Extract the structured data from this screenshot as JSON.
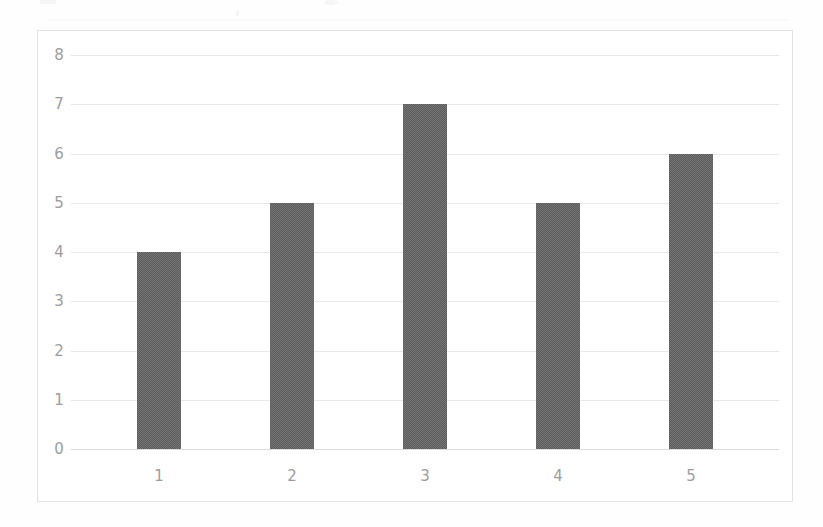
{
  "chart_data": {
    "type": "bar",
    "title": "",
    "subtitle": "",
    "xlabel": "",
    "ylabel": "",
    "categories": [
      "1",
      "2",
      "3",
      "4",
      "5"
    ],
    "values": [
      4,
      5,
      7,
      5,
      6
    ],
    "ylim": [
      0,
      8
    ],
    "yticks": [
      0,
      1,
      2,
      3,
      4,
      5,
      6,
      7,
      8
    ],
    "ytick_labels": [
      "0",
      "1",
      "2",
      "3",
      "4",
      "5",
      "6",
      "7",
      "8"
    ],
    "xtick_labels": [
      "1",
      "2",
      "3",
      "4",
      "5"
    ],
    "grid": "horizontal",
    "legend": "none",
    "annotations": [],
    "colors": {
      "bar_fill": "#5b5b5b",
      "gridline": "#e9e9ea",
      "baseline": "#dcdcdd",
      "frame_border": "#e3e3e4",
      "tick_label": "#9d9d9f",
      "plot_background": "#ffffff",
      "page_background": "#fefefe"
    }
  }
}
